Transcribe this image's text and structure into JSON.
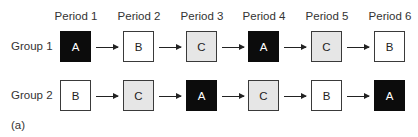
{
  "periods": [
    "Period 1",
    "Period 2",
    "Period 3",
    "Period 4",
    "Period 5",
    "Period 6"
  ],
  "groups": [
    {
      "label": "Group 1",
      "cells": [
        {
          "letter": "A",
          "fill": "black"
        },
        {
          "letter": "B",
          "fill": "white"
        },
        {
          "letter": "C",
          "fill": "gray"
        },
        {
          "letter": "A",
          "fill": "black"
        },
        {
          "letter": "C",
          "fill": "gray"
        },
        {
          "letter": "B",
          "fill": "white"
        }
      ]
    },
    {
      "label": "Group 2",
      "cells": [
        {
          "letter": "B",
          "fill": "white"
        },
        {
          "letter": "C",
          "fill": "gray"
        },
        {
          "letter": "A",
          "fill": "black"
        },
        {
          "letter": "C",
          "fill": "gray"
        },
        {
          "letter": "B",
          "fill": "white"
        },
        {
          "letter": "A",
          "fill": "black"
        }
      ]
    }
  ],
  "caption": "(a)",
  "colors": {
    "black": "#0c0c0c",
    "gray": "#e6e6e6",
    "white": "#ffffff"
  }
}
